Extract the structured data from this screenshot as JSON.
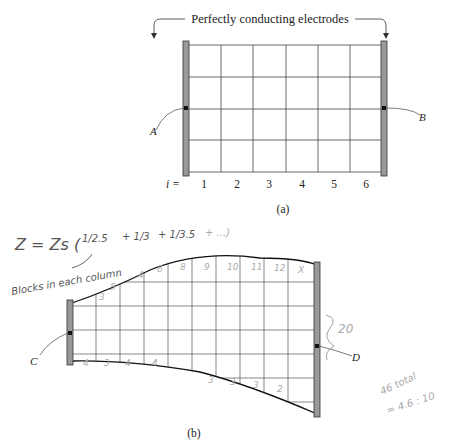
{
  "figure_a": {
    "title": "Perfectly conducting electrodes",
    "index_prefix": "i =",
    "column_indices": [
      "1",
      "2",
      "3",
      "4",
      "5",
      "6"
    ],
    "left_label": "A",
    "right_label": "B",
    "caption": "(a)",
    "grid": {
      "columns": 6,
      "rows": 4
    }
  },
  "figure_b": {
    "left_label": "C",
    "right_label": "D",
    "caption": "(b)",
    "top_counts": [
      "3",
      "5",
      "4",
      "6",
      "8",
      "9",
      "10",
      "11",
      "12",
      "X"
    ],
    "bottom_counts": [
      "4",
      "3",
      "4",
      "4",
      "3",
      "3",
      "3",
      "2"
    ],
    "brace_label": "20"
  },
  "annotations": {
    "formula_lhs": "Z = Zs (",
    "formula_terms": [
      "1/2.5",
      "+ 1/3",
      "+ 1/3.5",
      "+ ...)"
    ],
    "arrow_note": "Blocks in each column",
    "total_note_1": "46 total",
    "total_note_2": "= 4.6 : 10"
  }
}
